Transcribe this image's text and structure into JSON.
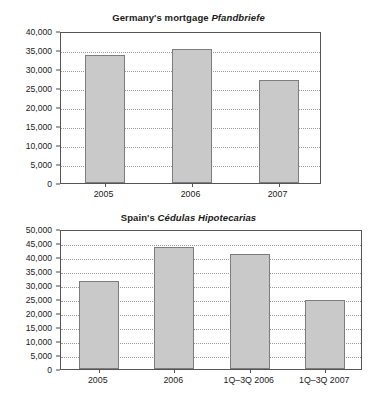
{
  "chart_data": [
    {
      "type": "bar",
      "id": "germany-pfandbriefe",
      "title": "Germany's mortgage Pfandbriefe",
      "title_plain": "Germany's mortgage ",
      "title_italic": "Pfandbriefe",
      "categories": [
        "2005",
        "2006",
        "2007"
      ],
      "values": [
        33700,
        35300,
        27200
      ],
      "xlabel": "",
      "ylabel": "",
      "ylim": [
        0,
        40000
      ],
      "ytick_values": [
        0,
        5000,
        10000,
        15000,
        20000,
        25000,
        30000,
        35000,
        40000
      ],
      "ytick_labels": [
        "0",
        "5,000",
        "10,000",
        "15,000",
        "20,000",
        "25,000",
        "30,000",
        "35,000",
        "40,000"
      ],
      "grid": true,
      "legend": false,
      "bar_fill": "#c9c9c9",
      "bar_border": "#7d7d7d"
    },
    {
      "type": "bar",
      "id": "spain-cedulas",
      "title": "Spain's Cédulas Hipotecarias",
      "title_plain": "Spain's ",
      "title_italic": "Cédulas Hipotecarias",
      "categories": [
        "2005",
        "2006",
        "1Q–3Q 2006",
        "1Q–3Q 2007"
      ],
      "values": [
        31600,
        43700,
        41200,
        24800
      ],
      "xlabel": "",
      "ylabel": "",
      "ylim": [
        0,
        50000
      ],
      "ytick_values": [
        0,
        5000,
        10000,
        15000,
        20000,
        25000,
        30000,
        35000,
        40000,
        45000,
        50000
      ],
      "ytick_labels": [
        "0",
        "5,000",
        "10,000",
        "15,000",
        "20,000",
        "25,000",
        "30,000",
        "35,000",
        "40,000",
        "45,000",
        "50,000"
      ],
      "grid": true,
      "legend": false,
      "bar_fill": "#c9c9c9",
      "bar_border": "#7d7d7d"
    }
  ]
}
